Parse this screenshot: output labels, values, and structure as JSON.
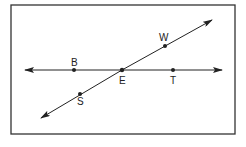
{
  "diagram": {
    "type": "intersecting-lines",
    "frame": {
      "x": 11,
      "y": 5,
      "width": 224,
      "height": 129
    },
    "lines": [
      {
        "name": "line-BT",
        "from": [
          25,
          70
        ],
        "to": [
          222,
          70
        ],
        "double_arrow": true
      },
      {
        "name": "line-SW",
        "from": [
          41,
          118
        ],
        "to": [
          212,
          20
        ],
        "double_arrow": true
      }
    ],
    "points": [
      {
        "id": "B",
        "label": "B",
        "x": 74,
        "y": 70,
        "label_x": 71,
        "label_y": 66
      },
      {
        "id": "E",
        "label": "E",
        "x": 122,
        "y": 70,
        "label_x": 119,
        "label_y": 84
      },
      {
        "id": "T",
        "label": "T",
        "x": 173,
        "y": 70,
        "label_x": 170,
        "label_y": 84
      },
      {
        "id": "W",
        "label": "W",
        "x": 165,
        "y": 46,
        "label_x": 159,
        "label_y": 41
      },
      {
        "id": "S",
        "label": "S",
        "x": 80,
        "y": 94,
        "label_x": 77,
        "label_y": 105
      }
    ],
    "colors": {
      "line": "#222222",
      "frame": "#333333",
      "background": "#ffffff"
    }
  }
}
